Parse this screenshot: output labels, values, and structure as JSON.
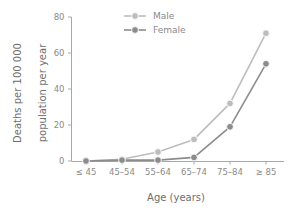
{
  "chart_data": {
    "type": "line",
    "title": "",
    "subtitle": "",
    "xlabel": "Age (years)",
    "ylabel": "Deaths per 100 000 population per year",
    "ylabel_line1": "Deaths per 100 000",
    "ylabel_line2": "population per year",
    "categories": [
      "≤ 45",
      "45–54",
      "55–64",
      "65–74",
      "75–84",
      "≥ 85"
    ],
    "ylim": [
      0,
      80
    ],
    "yticks": [
      0,
      20,
      40,
      60,
      80
    ],
    "ytick_labels": [
      "0",
      "20",
      "40",
      "60",
      "80"
    ],
    "grid": false,
    "legend_position": "top-center",
    "series": [
      {
        "name": "Male",
        "color": "#bdbdbd",
        "marker": "circle",
        "values": [
          0,
          1,
          5,
          12,
          32,
          71
        ]
      },
      {
        "name": "Female",
        "color": "#8c8c8c",
        "marker": "circle",
        "values": [
          0,
          0.5,
          0.5,
          2,
          19,
          54
        ]
      }
    ]
  },
  "axis": {
    "y_title_line1": "Deaths per 100 000",
    "y_title_line2": "population per year",
    "x_title": "Age (years)"
  },
  "legend": {
    "items": [
      {
        "label": "Male",
        "color": "#bdbdbd"
      },
      {
        "label": "Female",
        "color": "#8c8c8c"
      }
    ]
  },
  "colors": {
    "male": "#bdbdbd",
    "female": "#8c8c8c",
    "axis": "#a8a8a8",
    "text": "#7a7a7a",
    "background": "#ffffff"
  }
}
